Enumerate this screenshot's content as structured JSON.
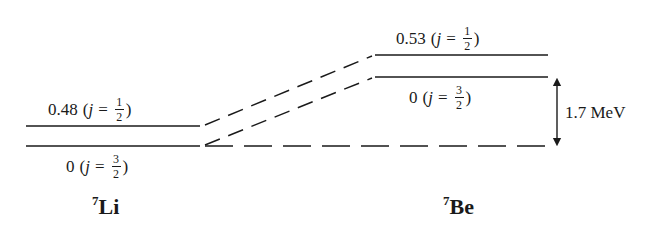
{
  "diagram": {
    "nuclei": [
      {
        "name": "Li",
        "mass_number": "7",
        "levels": [
          {
            "energy": "0.48",
            "j_num": "1",
            "j_den": "2",
            "label_position": "above"
          },
          {
            "energy": "0",
            "j_num": "3",
            "j_den": "2",
            "label_position": "below"
          }
        ]
      },
      {
        "name": "Be",
        "mass_number": "7",
        "levels": [
          {
            "energy": "0.53",
            "j_num": "1",
            "j_den": "2",
            "label_position": "above"
          },
          {
            "energy": "0",
            "j_num": "3",
            "j_den": "2",
            "label_position": "below"
          }
        ]
      }
    ],
    "j_symbol": "j",
    "equals": "=",
    "open_paren": "(",
    "close_paren": ")",
    "energy_gap": {
      "value": "1.7",
      "unit": "MeV",
      "text": "1.7 MeV"
    },
    "colors": {
      "line": "#1a1a1a",
      "background": "#ffffff"
    }
  }
}
